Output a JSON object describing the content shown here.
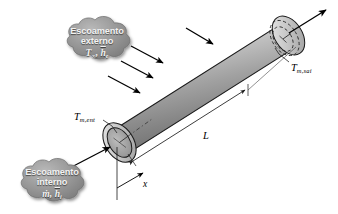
{
  "figure": {
    "name": "internal-external-flow-tube-diagram",
    "background_color": "#ffffff"
  },
  "callouts": {
    "external": {
      "line1": "Escoamento",
      "line2": "externo",
      "symbols_html": "T∞, h̄e",
      "symbol_main": "T",
      "symbol_sub": "∞",
      "symbol_main2": "h",
      "symbol_sub2": "e",
      "fill_color": "#8f8f8f",
      "text_color": "#f2f2f2"
    },
    "internal": {
      "line1": "Escoamento",
      "line2": "interno",
      "symbols_html": "ṁ, h̄i",
      "symbol_main": "ṁ",
      "symbol_main2": "h",
      "symbol_sub2": "i",
      "fill_color": "#8f8f8f",
      "text_color": "#f2f2f2"
    }
  },
  "labels": {
    "inlet_temperature": {
      "base": "T",
      "sub": "m,ent"
    },
    "outlet_temperature": {
      "base": "T",
      "sub": "m,sai"
    },
    "length": {
      "base": "L",
      "sub": ""
    },
    "axis_x": {
      "base": "x",
      "sub": ""
    }
  },
  "tube": {
    "body_color_light": "#efefef",
    "body_color_mid": "#b4b4b4",
    "body_color_dark": "#6e6e6e",
    "outline_color": "#1a1a1a",
    "end_cap_color": "#c9c9c9",
    "inner_bore_color": "#a8a8a8"
  },
  "arrows": {
    "external_flow_count": 3,
    "color": "#000000",
    "inlet_label": "inlet-flow-arrow",
    "outlet_label": "outlet-flow-arrow"
  },
  "dimension": {
    "length_line_label": "L",
    "axis_label": "x",
    "line_color": "#1a1a1a"
  }
}
